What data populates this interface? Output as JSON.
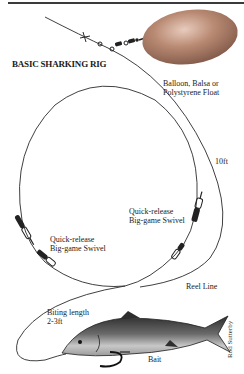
{
  "title": "BASIC SHARKING RIG",
  "labels": {
    "float_line1": "Balloon, Balsa or",
    "float_line2": "Polystyrene Float",
    "length_10ft": "10ft",
    "swivel_right_line1": "Quick-release",
    "swivel_right_line2": "Big-game Swivel",
    "swivel_left_line1": "Quick-release",
    "swivel_left_line2": "Big-game Swivel",
    "reel_line": "Reel Line",
    "biting_line1": "Biting length",
    "biting_line2": "2-3ft",
    "bait": "Bait"
  },
  "credit": "Rod Sutterby",
  "colors": {
    "float": "#b07a62",
    "float_highlight": "#e2c4b4",
    "line": "#2a2a2a",
    "fish_dark": "#3a3a3a",
    "fish_light": "#bdbdbd"
  }
}
